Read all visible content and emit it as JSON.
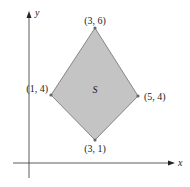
{
  "diagram": {
    "type": "region-in-plane",
    "region_label": "S",
    "axes": {
      "x_label": "x",
      "y_label": "y"
    },
    "vertices": [
      {
        "name": "top",
        "label": "(3, 6)",
        "x": 3,
        "y": 6
      },
      {
        "name": "right",
        "label": "(5, 4)",
        "x": 5,
        "y": 4
      },
      {
        "name": "bottom",
        "label": "(3, 1)",
        "x": 3,
        "y": 1
      },
      {
        "name": "left",
        "label": "(1, 4)",
        "x": 1,
        "y": 4
      }
    ],
    "colors": {
      "fill": "#c4c4c4",
      "stroke": "#6e6e6e",
      "axis": "#333333",
      "point": "#666666"
    }
  }
}
